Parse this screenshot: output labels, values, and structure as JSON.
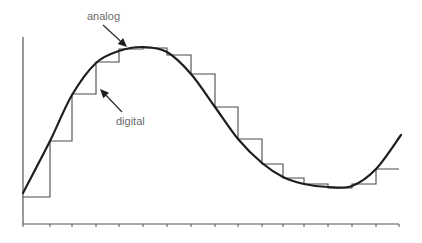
{
  "labels": {
    "analog": "analog",
    "digital": "digital"
  },
  "colors": {
    "analog_curve": "#1e1e1e",
    "digital_steps": "#4a4a4a",
    "label_text": "#6a6a6a"
  },
  "chart_data": {
    "type": "line",
    "title": "",
    "xlabel": "",
    "ylabel": "",
    "grid": false,
    "legend": "annotations (arrows)",
    "annotations": [
      {
        "text": "analog",
        "target": "smooth curve near peak"
      },
      {
        "text": "digital",
        "target": "step function"
      }
    ],
    "x_ticks_count": 17,
    "series": [
      {
        "name": "analog",
        "style": "smooth curve",
        "points_px": [
          [
            23,
            193
          ],
          [
            50,
            141
          ],
          [
            72,
            95
          ],
          [
            96,
            63
          ],
          [
            119,
            51
          ],
          [
            143,
            47
          ],
          [
            167,
            52
          ],
          [
            191,
            74
          ],
          [
            215,
            107
          ],
          [
            238,
            139
          ],
          [
            262,
            163
          ],
          [
            283,
            177
          ],
          [
            304,
            184
          ],
          [
            328,
            187
          ],
          [
            352,
            186
          ],
          [
            376,
            169
          ],
          [
            401,
            135
          ]
        ]
      },
      {
        "name": "digital",
        "style": "sample-and-hold steps",
        "sample_x_px": [
          23,
          50,
          72,
          96,
          119,
          143,
          167,
          191,
          215,
          238,
          262,
          283,
          304,
          328,
          352,
          376,
          399
        ],
        "held_y_px": [
          197,
          141,
          94,
          62,
          49,
          48,
          55,
          74,
          107,
          139,
          164,
          178,
          184,
          188,
          184,
          169
        ]
      }
    ]
  },
  "axes": {
    "origin_px": [
      23,
      224
    ],
    "y_top_px": 37,
    "x_end_px": 399,
    "tick_len_px": 3
  },
  "arrows": {
    "analog": {
      "from": [
        103,
        25
      ],
      "to": [
        127,
        47
      ]
    },
    "digital": {
      "from": [
        122,
        112
      ],
      "to": [
        100,
        89
      ]
    }
  }
}
